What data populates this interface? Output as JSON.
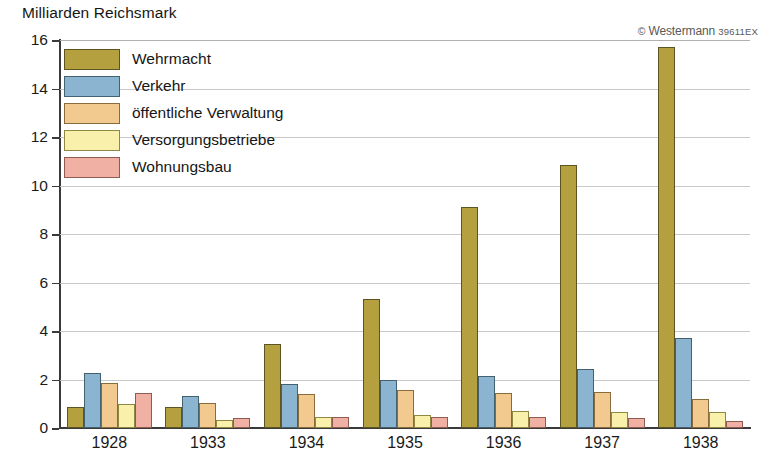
{
  "chart_data": {
    "type": "bar",
    "title": "Milliarden Reichsmark",
    "xlabel": "",
    "ylabel": "Milliarden Reichsmark",
    "ylim": [
      0,
      16
    ],
    "ytick_step": 2,
    "yticks": [
      "0",
      "2",
      "4",
      "6",
      "8",
      "10",
      "12",
      "14",
      "16"
    ],
    "grid": true,
    "legend_position": "top-left",
    "categories": [
      "1928",
      "1933",
      "1934",
      "1935",
      "1936",
      "1937",
      "1938"
    ],
    "series": [
      {
        "name": "Wehrmacht",
        "color": "#b5a03f",
        "values": [
          0.85,
          0.85,
          3.45,
          5.3,
          9.1,
          10.85,
          15.7
        ]
      },
      {
        "name": "Verkehr",
        "color": "#8ab4d0",
        "values": [
          2.25,
          1.3,
          1.8,
          2.0,
          2.15,
          2.45,
          3.7
        ]
      },
      {
        "name": "öffentliche Verwaltung",
        "color": "#f2c98e",
        "values": [
          1.85,
          1.05,
          1.4,
          1.55,
          1.45,
          1.5,
          1.2
        ]
      },
      {
        "name": "Versorgungsbetriebe",
        "color": "#f9f0ac",
        "values": [
          1.0,
          0.35,
          0.45,
          0.55,
          0.7,
          0.65,
          0.65
        ]
      },
      {
        "name": "Wohnungsbau",
        "color": "#f0b0a3",
        "values": [
          1.45,
          0.4,
          0.45,
          0.45,
          0.45,
          0.4,
          0.3
        ]
      }
    ]
  },
  "credit": {
    "mark": "©",
    "name": "Westermann",
    "code": "39611EX"
  }
}
